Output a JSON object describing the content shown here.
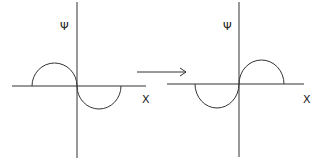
{
  "diagram": {
    "left_panel": {
      "y_axis_label": "Ψ",
      "x_axis_label": "X",
      "description": "wave with positive lobe at negative x, negative lobe at positive x"
    },
    "transition": {
      "arrow_icon": "right-arrow-icon"
    },
    "right_panel": {
      "y_axis_label": "Ψ",
      "x_axis_label": "X",
      "description": "wave with negative lobe at negative x, positive lobe at positive x"
    },
    "colors": {
      "line": "#333333",
      "background": "#ffffff"
    }
  }
}
